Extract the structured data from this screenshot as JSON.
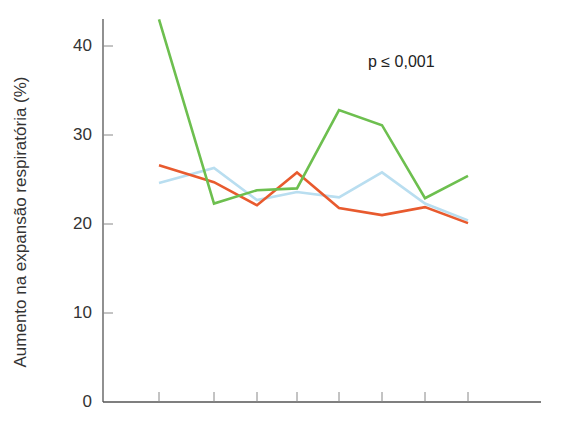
{
  "chart_data": {
    "type": "line",
    "title": "",
    "xlabel": "",
    "ylabel": "Aumento na expansão respiratória (%)",
    "ylim": [
      0,
      43
    ],
    "yticks": [
      0,
      10,
      20,
      30,
      40
    ],
    "x": [
      1,
      2,
      3,
      4,
      5,
      6,
      7,
      8
    ],
    "xtick_labels": [],
    "grid": false,
    "legend": null,
    "annotations": [
      "p ≤ 0,001"
    ],
    "series": [
      {
        "name": "green",
        "color": "#6dbf4f",
        "values": [
          43.0,
          22.3,
          23.8,
          24.0,
          32.8,
          31.1,
          22.9,
          25.4
        ]
      },
      {
        "name": "orange",
        "color": "#e85a2e",
        "values": [
          26.6,
          24.7,
          22.1,
          25.8,
          21.8,
          21.0,
          21.9,
          20.1
        ]
      },
      {
        "name": "light-blue",
        "color": "#b9def0",
        "values": [
          24.6,
          26.3,
          22.7,
          23.6,
          23.0,
          25.8,
          22.3,
          20.4
        ]
      }
    ]
  },
  "axis": {
    "y_tick_labels": [
      "0",
      "10",
      "20",
      "30",
      "40"
    ]
  },
  "annotation_text": "p ≤ 0,001"
}
